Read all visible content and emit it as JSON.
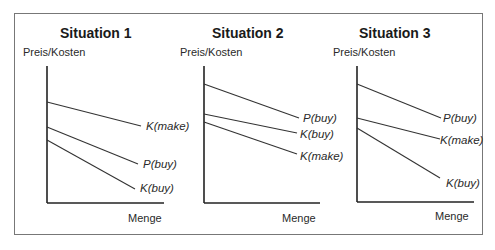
{
  "diagram": {
    "panels": [
      {
        "title": "Situation 1",
        "ylabel": "Preis/Kosten",
        "xlabel": "Menge",
        "curves": [
          {
            "label": "K(make)",
            "order": 1
          },
          {
            "label": "P(buy)",
            "order": 2
          },
          {
            "label": "K(buy)",
            "order": 3
          }
        ]
      },
      {
        "title": "Situation 2",
        "ylabel": "Preis/Kosten",
        "xlabel": "Menge",
        "curves": [
          {
            "label": "P(buy)",
            "order": 1
          },
          {
            "label": "K(buy)",
            "order": 2
          },
          {
            "label": "K(make)",
            "order": 3
          }
        ]
      },
      {
        "title": "Situation 3",
        "ylabel": "Preis/Kosten",
        "xlabel": "Menge",
        "curves": [
          {
            "label": "P(buy)",
            "order": 1
          },
          {
            "label": "K(make)",
            "order": 2
          },
          {
            "label": "K(buy)",
            "order": 3
          }
        ]
      }
    ]
  }
}
